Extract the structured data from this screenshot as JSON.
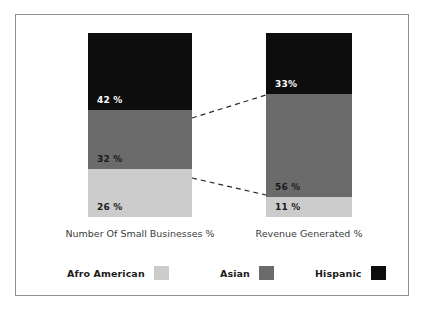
{
  "chart_data": {
    "type": "bar",
    "subtype": "stacked-100-percent",
    "title": "",
    "subtitle": "",
    "xlabel": "",
    "ylabel": "",
    "ylim": [
      0,
      100
    ],
    "grid": false,
    "legend_position": "bottom",
    "categories": [
      "Number Of Small Businesses %",
      "Revenue Generated %"
    ],
    "series": [
      {
        "name": "Afro American",
        "color": "#cccccc",
        "values": [
          26,
          11
        ],
        "labels": [
          "26 %",
          "11 %"
        ],
        "label_color": "dark"
      },
      {
        "name": "Asian",
        "color": "#6b6b6b",
        "values": [
          32,
          56
        ],
        "labels": [
          "32 %",
          "56 %"
        ],
        "label_color": "dark"
      },
      {
        "name": "Hispanic",
        "color": "#0d0d0d",
        "values": [
          42,
          33
        ],
        "labels": [
          "42 %",
          "33%"
        ],
        "label_color": "light"
      }
    ],
    "annotations": [
      {
        "type": "dashed-connector",
        "from": "Number Of Small Businesses % Hispanic/Asian boundary",
        "to": "Revenue Generated % Hispanic/Asian boundary"
      },
      {
        "type": "dashed-connector",
        "from": "Number Of Small Businesses % Asian/Afro American boundary",
        "to": "Revenue Generated % Asian/Afro American boundary"
      }
    ]
  },
  "legend": {
    "items": [
      {
        "label": "Afro American",
        "color": "#cccccc"
      },
      {
        "label": "Asian",
        "color": "#6b6b6b"
      },
      {
        "label": "Hispanic",
        "color": "#0d0d0d"
      }
    ]
  },
  "frame": {
    "border_color": "#8d8f92",
    "background": "#ffffff"
  },
  "connector": {
    "color": "#2b2b2b"
  }
}
